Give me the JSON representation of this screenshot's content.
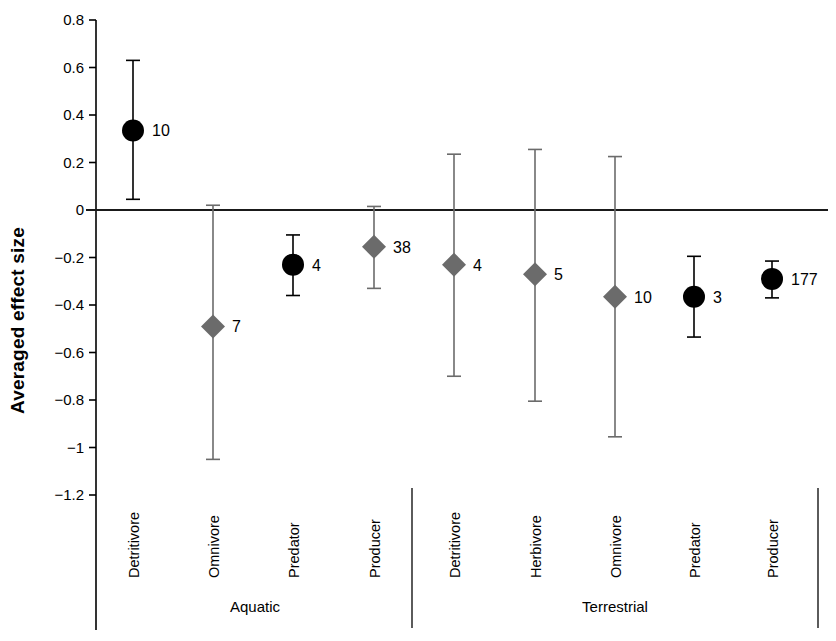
{
  "chart": {
    "type": "scatter",
    "ylabel": "Averaged effect size",
    "xlabel": "",
    "title": ""
  },
  "axis": {
    "y_ticks": [
      "0.8",
      "0.6",
      "0.4",
      "0.2",
      "0",
      "−0.2",
      "−0.4",
      "−0.6",
      "−0.8",
      "−1",
      "−1.2"
    ],
    "y_tick_values": [
      0.8,
      0.6,
      0.4,
      0.2,
      0,
      -0.2,
      -0.4,
      -0.6,
      -0.8,
      -1.0,
      -1.2
    ],
    "ymin": -1.2,
    "ymax": 0.8,
    "zero_reference": 0
  },
  "groups": [
    {
      "name": "Aquatic"
    },
    {
      "name": "Terrestrial"
    }
  ],
  "colors": {
    "black_marker": "#000000",
    "gray_marker": "#6b6b6b",
    "axis": "#000000",
    "zero_line": "#1a1a1a",
    "divider": "#4a4a4a",
    "background": "#ffffff"
  },
  "chart_data": {
    "type": "scatter",
    "title": "",
    "xlabel": "",
    "ylabel": "Averaged effect size",
    "ylim": [
      -1.2,
      0.8
    ],
    "grid": false,
    "legend": "none",
    "yticks": [
      0.8,
      0.6,
      0.4,
      0.2,
      0,
      -0.2,
      -0.4,
      -0.6,
      -0.8,
      -1.0,
      -1.2
    ],
    "ytick_labels": [
      "0.8",
      "0.6",
      "0.4",
      "0.2",
      "0",
      "−0.2",
      "−0.4",
      "−0.6",
      "−0.8",
      "−1",
      "−1.2"
    ],
    "groups": [
      "Aquatic",
      "Terrestrial"
    ],
    "annotation": "Numbers next to each marker are sample sizes (n).",
    "points": [
      {
        "group": "Aquatic",
        "category": "Detritivore",
        "value": 0.335,
        "ci_low": 0.045,
        "ci_high": 0.63,
        "n_label": "10",
        "marker": "circle",
        "color": "#000000"
      },
      {
        "group": "Aquatic",
        "category": "Omnivore",
        "value": -0.49,
        "ci_low": -1.05,
        "ci_high": 0.02,
        "n_label": "7",
        "marker": "diamond",
        "color": "#6b6b6b"
      },
      {
        "group": "Aquatic",
        "category": "Predator",
        "value": -0.23,
        "ci_low": -0.36,
        "ci_high": -0.105,
        "n_label": "4",
        "marker": "circle",
        "color": "#000000"
      },
      {
        "group": "Aquatic",
        "category": "Producer",
        "value": -0.155,
        "ci_low": -0.33,
        "ci_high": 0.015,
        "n_label": "38",
        "marker": "diamond",
        "color": "#6b6b6b"
      },
      {
        "group": "Terrestrial",
        "category": "Detritivore",
        "value": -0.23,
        "ci_low": -0.7,
        "ci_high": 0.235,
        "n_label": "4",
        "marker": "diamond",
        "color": "#6b6b6b"
      },
      {
        "group": "Terrestrial",
        "category": "Herbivore",
        "value": -0.27,
        "ci_low": -0.805,
        "ci_high": 0.255,
        "n_label": "5",
        "marker": "diamond",
        "color": "#6b6b6b"
      },
      {
        "group": "Terrestrial",
        "category": "Omnivore",
        "value": -0.365,
        "ci_low": -0.955,
        "ci_high": 0.225,
        "n_label": "10",
        "marker": "diamond",
        "color": "#6b6b6b"
      },
      {
        "group": "Terrestrial",
        "category": "Predator",
        "value": -0.365,
        "ci_low": -0.535,
        "ci_high": -0.195,
        "n_label": "3",
        "marker": "circle",
        "color": "#000000"
      },
      {
        "group": "Terrestrial",
        "category": "Producer",
        "value": -0.29,
        "ci_low": -0.37,
        "ci_high": -0.215,
        "n_label": "177",
        "marker": "circle",
        "color": "#000000"
      }
    ]
  }
}
